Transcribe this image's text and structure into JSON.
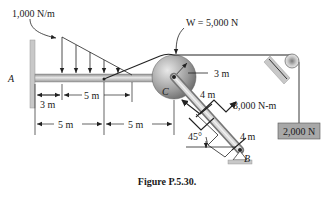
{
  "figure": {
    "caption": "Figure P.5.30.",
    "labels": {
      "distributed_load": "1,000 N/m",
      "weight": "W = 5,000 N",
      "moment": "3,000 N-m",
      "hanging_weight": "2,000 N",
      "point_a": "A",
      "point_b": "B",
      "point_c": "C",
      "angle": "45°"
    },
    "dimensions": {
      "radius": "3 m",
      "arm_upper": "4 m",
      "arm_lower": "4 m",
      "dim_3m": "3 m",
      "dim_5m_top": "5 m",
      "dim_5m_left": "5 m",
      "dim_5m_right": "5 m"
    },
    "colors": {
      "beam": "#b0b0b0",
      "wall": "#c8c8c8",
      "pulley_dark": "#6a6a6a",
      "pulley_light": "#d8d8d8",
      "weight_box": "#a8a8a8",
      "line": "#222222"
    }
  }
}
